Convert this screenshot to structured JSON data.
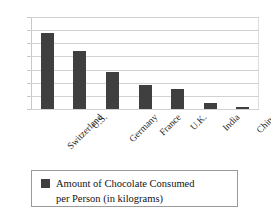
{
  "chart_data": {
    "type": "bar",
    "title": "",
    "xlabel": "",
    "ylabel": "",
    "categories": [
      "Switzerland",
      "U.S.",
      "Germany",
      "France",
      "U.K.",
      "India",
      "China"
    ],
    "values": [
      11.6,
      8.8,
      5.6,
      3.6,
      3.0,
      0.9,
      0.3
    ],
    "series": [
      {
        "name": "Amount of Chocolate Consumed per Person (in kilograms)",
        "values": [
          11.6,
          8.8,
          5.6,
          3.6,
          3.0,
          0.9,
          0.3
        ]
      }
    ],
    "ylim": [
      0,
      14
    ],
    "yticks": [
      0,
      2,
      4,
      6,
      8,
      10,
      12,
      14
    ],
    "ytick_labels": [
      "0",
      "2",
      "4",
      "6",
      "8",
      "10",
      "12",
      "14"
    ],
    "grid": true,
    "grid_axis": "y",
    "legend_position": "bottom",
    "bar_color": "#3f3f3f",
    "gridline_color": "#d2d2d2",
    "xtick_rotation": -45
  },
  "legend": {
    "swatch_color": "#3f3f3f",
    "line1": "Amount of Chocolate Consumed",
    "line2": "per Person (in kilograms)"
  }
}
